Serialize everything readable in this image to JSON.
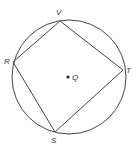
{
  "diagram": {
    "type": "inscribed-quadrilateral",
    "circle": {
      "cx": 69,
      "cy": 77,
      "r": 57,
      "stroke": "#444444"
    },
    "center": {
      "label": "Q",
      "x": 68,
      "y": 77
    },
    "vertices": [
      {
        "label": "V",
        "x": 60,
        "y": 21
      },
      {
        "label": "T",
        "x": 123,
        "y": 70
      },
      {
        "label": "S",
        "x": 55,
        "y": 132
      },
      {
        "label": "R",
        "x": 13,
        "y": 62
      }
    ],
    "polygon_order": [
      "V",
      "T",
      "S",
      "R"
    ],
    "labels": {
      "V": "V",
      "R": "R",
      "T": "T",
      "S": "S",
      "Q": "Q"
    }
  }
}
